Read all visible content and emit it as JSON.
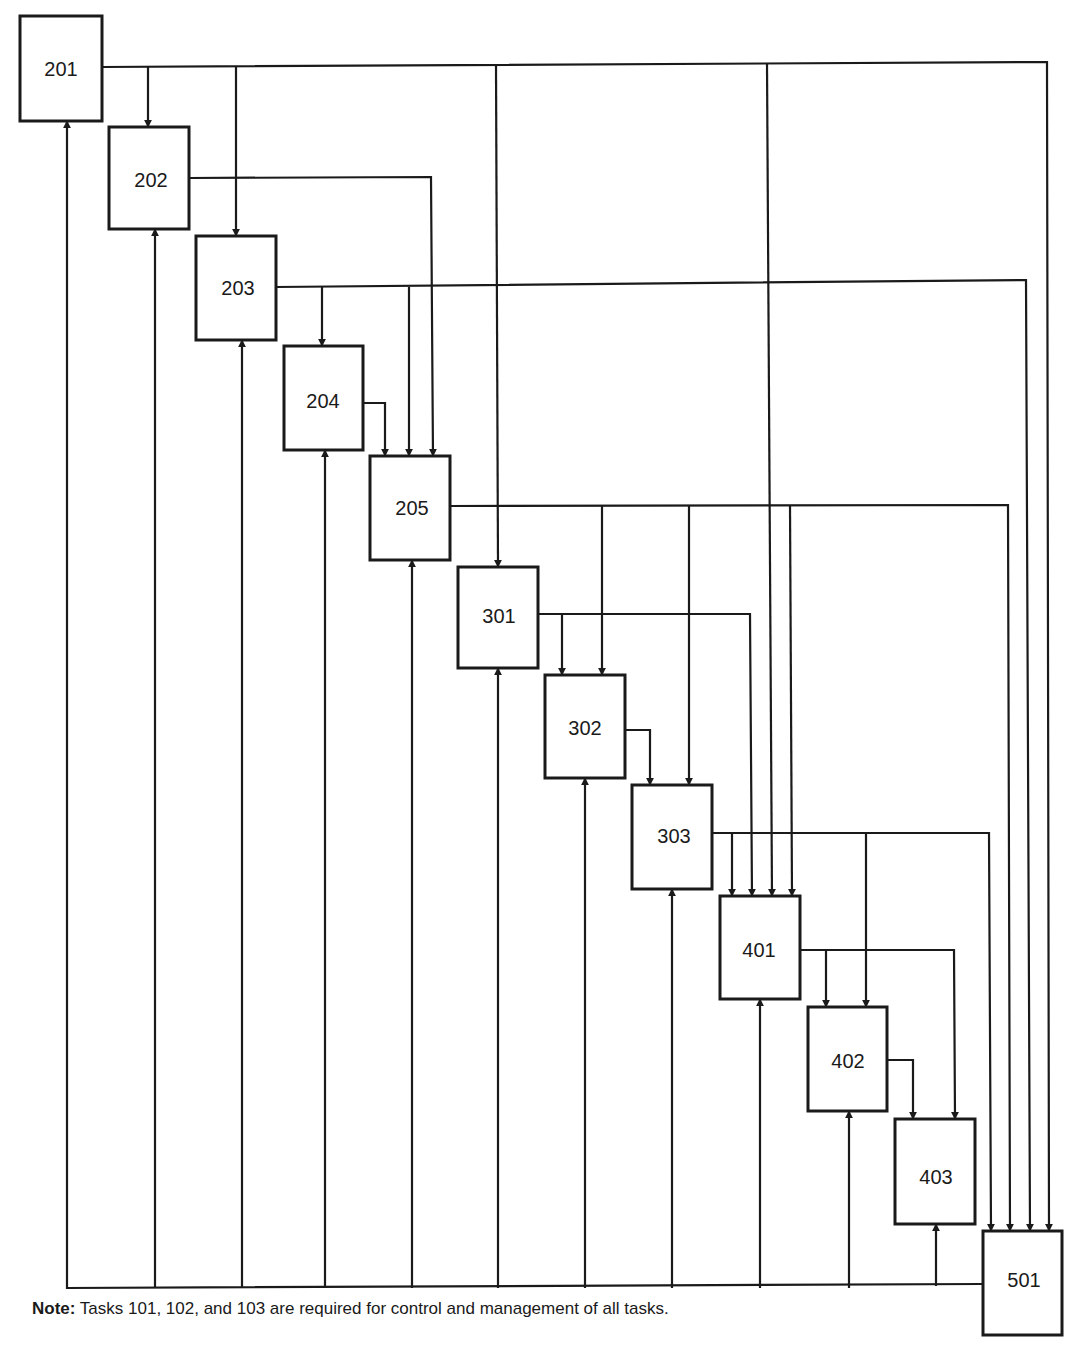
{
  "diagram": {
    "type": "task-dependency-network",
    "nodes": [
      {
        "id": "201",
        "label": "201",
        "x": 20,
        "y": 16,
        "w": 82,
        "h": 105
      },
      {
        "id": "202",
        "label": "202",
        "x": 109,
        "y": 127,
        "w": 80,
        "h": 102
      },
      {
        "id": "203",
        "label": "203",
        "x": 196,
        "y": 236,
        "w": 80,
        "h": 104
      },
      {
        "id": "204",
        "label": "204",
        "x": 284,
        "y": 346,
        "w": 79,
        "h": 104
      },
      {
        "id": "205",
        "label": "205",
        "x": 370,
        "y": 456,
        "w": 80,
        "h": 104
      },
      {
        "id": "301",
        "label": "301",
        "x": 458,
        "y": 567,
        "w": 80,
        "h": 101
      },
      {
        "id": "302",
        "label": "302",
        "x": 545,
        "y": 675,
        "w": 80,
        "h": 103
      },
      {
        "id": "303",
        "label": "303",
        "x": 632,
        "y": 785,
        "w": 80,
        "h": 104
      },
      {
        "id": "401",
        "label": "401",
        "x": 720,
        "y": 896,
        "w": 80,
        "h": 103
      },
      {
        "id": "402",
        "label": "402",
        "x": 808,
        "y": 1007,
        "w": 79,
        "h": 104
      },
      {
        "id": "403",
        "label": "403",
        "x": 895,
        "y": 1119,
        "w": 80,
        "h": 105
      },
      {
        "id": "501",
        "label": "501",
        "x": 983,
        "y": 1231,
        "w": 79,
        "h": 104
      }
    ],
    "edges": [
      {
        "from": "201",
        "to": "202"
      },
      {
        "from": "201",
        "to": "203"
      },
      {
        "from": "201",
        "to": "301"
      },
      {
        "from": "201",
        "to": "401"
      },
      {
        "from": "201",
        "to": "501"
      },
      {
        "from": "202",
        "to": "205"
      },
      {
        "from": "203",
        "to": "204"
      },
      {
        "from": "203",
        "to": "205"
      },
      {
        "from": "203",
        "to": "501"
      },
      {
        "from": "204",
        "to": "205"
      },
      {
        "from": "205",
        "to": "302"
      },
      {
        "from": "205",
        "to": "303"
      },
      {
        "from": "205",
        "to": "401"
      },
      {
        "from": "205",
        "to": "501"
      },
      {
        "from": "301",
        "to": "302"
      },
      {
        "from": "301",
        "to": "401"
      },
      {
        "from": "302",
        "to": "303"
      },
      {
        "from": "303",
        "to": "401"
      },
      {
        "from": "303",
        "to": "402"
      },
      {
        "from": "303",
        "to": "501"
      },
      {
        "from": "401",
        "to": "402"
      },
      {
        "from": "401",
        "to": "403"
      },
      {
        "from": "402",
        "to": "403"
      },
      {
        "from": "501",
        "to": "201",
        "kind": "feedback"
      },
      {
        "from": "501",
        "to": "202",
        "kind": "feedback"
      },
      {
        "from": "501",
        "to": "203",
        "kind": "feedback"
      },
      {
        "from": "501",
        "to": "204",
        "kind": "feedback"
      },
      {
        "from": "501",
        "to": "205",
        "kind": "feedback"
      },
      {
        "from": "501",
        "to": "301",
        "kind": "feedback"
      },
      {
        "from": "501",
        "to": "302",
        "kind": "feedback"
      },
      {
        "from": "501",
        "to": "303",
        "kind": "feedback"
      },
      {
        "from": "501",
        "to": "401",
        "kind": "feedback"
      },
      {
        "from": "501",
        "to": "402",
        "kind": "feedback"
      },
      {
        "from": "501",
        "to": "403",
        "kind": "feedback"
      }
    ]
  },
  "note": {
    "label": "Note:",
    "text": " Tasks 101, 102, and 103 are required for control and management of all tasks."
  }
}
